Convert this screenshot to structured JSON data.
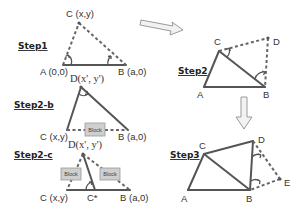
{
  "steps": {
    "step1": {
      "label": "Step1",
      "points": {
        "A": "A (0,0)",
        "B": "B (a,0)",
        "C": "C (x,y)"
      }
    },
    "step2b": {
      "label": "Step2-b",
      "points": {
        "D": "D(x', y')",
        "C": "C (x,y)",
        "B": "B (a,0)"
      },
      "block": "Block"
    },
    "step2c": {
      "label": "Step2-c",
      "points": {
        "D": "D(x', y')",
        "C": "C (x,y)",
        "Cstar": "C*",
        "B": "B (a,0)"
      },
      "blocks": [
        "Block",
        "Block"
      ]
    },
    "step2": {
      "label": "Step2",
      "points": {
        "A": "A",
        "B": "B",
        "C": "C",
        "D": "D"
      }
    },
    "step3": {
      "label": "Step3",
      "points": {
        "A": "A",
        "B": "B",
        "C": "C",
        "D": "D",
        "E": "E"
      }
    }
  },
  "arrows": [
    "right-arrow",
    "down-arrow"
  ],
  "colors": {
    "line": "#555555",
    "block_fill": "#cfcfcf",
    "arrow_fill": "#f2f2f2"
  }
}
